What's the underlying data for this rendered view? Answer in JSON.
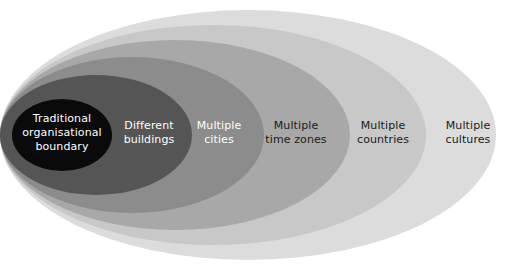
{
  "diagram": {
    "type": "nested-ellipse-venn",
    "title": "",
    "background_color": "#ffffff",
    "canvas": {
      "width": 510,
      "height": 271
    },
    "rings": [
      {
        "id": "multiple-cultures",
        "label": "Multiple\ncultures",
        "level": 6,
        "fill_color": "#dcdcdc",
        "text_color": "#1a1a1a",
        "cx": 248,
        "cy": 135,
        "rx": 248,
        "ry": 125
      },
      {
        "id": "multiple-countries",
        "label": "Multiple\ncountries",
        "level": 5,
        "fill_color": "#c8c8c8",
        "text_color": "#1a1a1a",
        "cx": 213,
        "cy": 135,
        "rx": 213,
        "ry": 110
      },
      {
        "id": "multiple-time-zones",
        "label": "Multiple\ntime zones",
        "level": 4,
        "fill_color": "#a8a8a8",
        "text_color": "#1a1a1a",
        "cx": 175,
        "cy": 135,
        "rx": 175,
        "ry": 95
      },
      {
        "id": "multiple-cities",
        "label": "Multiple\ncities",
        "level": 3,
        "fill_color": "#8c8c8c",
        "text_color": "#ffffff",
        "cx": 132,
        "cy": 135,
        "rx": 132,
        "ry": 78
      },
      {
        "id": "different-buildings",
        "label": "Different\nbuildings",
        "level": 2,
        "fill_color": "#555555",
        "text_color": "#ffffff",
        "cx": 96,
        "cy": 135,
        "rx": 96,
        "ry": 60
      },
      {
        "id": "traditional-organisational-boundary",
        "label": "Traditional\norganisational\nboundary",
        "level": 1,
        "fill_color": "#0a0a0a",
        "text_color": "#ffffff",
        "cx": 62,
        "cy": 135,
        "rx": 50,
        "ry": 36
      }
    ]
  }
}
